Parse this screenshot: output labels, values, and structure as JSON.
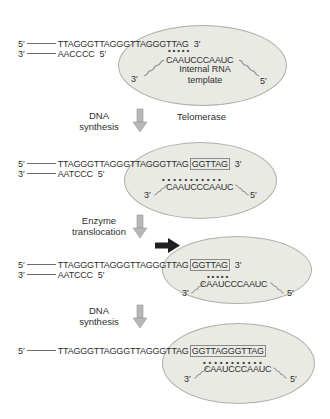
{
  "colors": {
    "ellipse_fill": "#e9eae4",
    "ellipse_border": "#b0b0aa",
    "gray_arrow": "#b7b7b7",
    "black_arrow": "#1f1f1f",
    "text": "#2e2e2e"
  },
  "panels": [
    {
      "top_strand": {
        "left": "5′",
        "seq": "TTAGGGTTAGGGTTAGGGTTAG",
        "right": "3′"
      },
      "bottom_strand": {
        "left": "3′",
        "seq": "AACCCC",
        "right": "5′"
      },
      "pairing_dots": "•••••",
      "rna": {
        "left": "3′",
        "seq": "CAAUCCCAAUC",
        "right": "5′"
      },
      "enzyme_label_line1": "Internal RNA",
      "enzyme_label_line2": "template"
    },
    {
      "step": {
        "line1": "DNA",
        "line2": "synthesis",
        "side_label": "Telomerase"
      },
      "top_strand": {
        "left": "5′",
        "seq": "TTAGGGTTAGGGTTAGGGTTAG",
        "boxed": "GGTTAG",
        "right": "3′"
      },
      "bottom_strand": {
        "left": "3′",
        "seq": "AATCCC",
        "right": "5′"
      },
      "pairing_dots": "•••••••••••",
      "rna": {
        "left": "3′",
        "seq": "CAAUCCCAAUC",
        "right": "5′"
      }
    },
    {
      "step": {
        "line1": "Enzyme",
        "line2": "translocation"
      },
      "top_strand": {
        "left": "5′",
        "seq": "TTAGGGTTAGGGTTAGGGTTAG",
        "boxed": "GGTTAG",
        "right": "3′"
      },
      "bottom_strand": {
        "left": "3′",
        "seq": "AATCCC",
        "right": "5′"
      },
      "pairing_dots": "•••••",
      "rna": {
        "left": "3′",
        "seq": "CAAUCCCAAUC",
        "right": "5′"
      }
    },
    {
      "step": {
        "line1": "DNA",
        "line2": "synthesis"
      },
      "top_strand": {
        "left": "5′",
        "seq": "TTAGGGTTAGGGTTAGGGTTAG",
        "boxed": "GGTTAGGGTTAG"
      },
      "pairing_dots": "•••••••••••",
      "rna": {
        "left": "3′",
        "seq": "CAAUCCCAAUC",
        "right": "5′"
      }
    }
  ]
}
